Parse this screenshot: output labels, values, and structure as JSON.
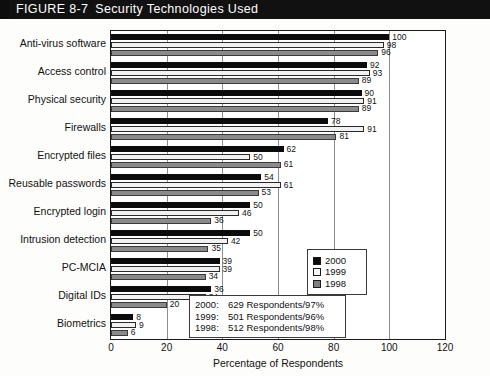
{
  "figure": {
    "label": "FIGURE 8-7",
    "title": "Security Technologies Used"
  },
  "chart_data": {
    "type": "bar",
    "orientation": "horizontal",
    "title": "Security Technologies Used",
    "xlabel": "Percentage of Respondents",
    "ylabel": "",
    "xlim": [
      0,
      120
    ],
    "xticks": [
      0,
      20,
      40,
      60,
      80,
      100,
      120
    ],
    "grid": true,
    "grid_axis": "x",
    "legend_position": "right",
    "categories": [
      "Anti-virus software",
      "Access control",
      "Physical security",
      "Firewalls",
      "Encrypted files",
      "Reusable passwords",
      "Encrypted login",
      "Intrusion detection",
      "PC-MCIA",
      "Digital IDs",
      "Biometrics"
    ],
    "series": [
      {
        "name": "2000",
        "color": "#0b0b0b",
        "values": [
          100,
          92,
          90,
          78,
          62,
          54,
          50,
          50,
          39,
          36,
          8
        ]
      },
      {
        "name": "1999",
        "color": "#f2f2f2",
        "values": [
          98,
          93,
          91,
          91,
          50,
          61,
          46,
          42,
          39,
          34,
          9
        ]
      },
      {
        "name": "1998",
        "color": "#8a8a8a",
        "values": [
          96,
          89,
          89,
          81,
          61,
          53,
          36,
          35,
          34,
          20,
          6
        ]
      }
    ]
  },
  "legend": {
    "items": [
      {
        "label": "2000",
        "swatch": "s2000"
      },
      {
        "label": "1999",
        "swatch": "s1999"
      },
      {
        "label": "1998",
        "swatch": "s1998"
      }
    ]
  },
  "note_box": {
    "lines": [
      {
        "year": "2000:",
        "text": "629 Respondents/97%"
      },
      {
        "year": "1999:",
        "text": "501 Respondents/96%"
      },
      {
        "year": "1998:",
        "text": "512 Respondents/98%"
      }
    ]
  },
  "source": {
    "text": "Source: Based on data published by ..."
  }
}
